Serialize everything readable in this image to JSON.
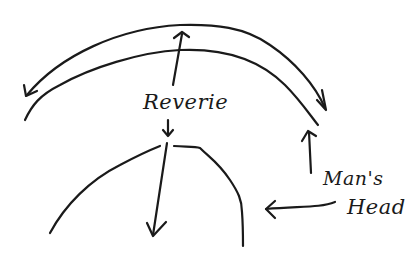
{
  "diagram": {
    "labels": {
      "reverie": "Reverie",
      "mans": "Man's",
      "head": "Head"
    },
    "elements": [
      {
        "id": "outer-arc",
        "type": "arc",
        "arrowheads": [
          "left-end",
          "right-end"
        ]
      },
      {
        "id": "inner-arc",
        "type": "arc"
      },
      {
        "id": "head-arc",
        "type": "arc",
        "description": "top of head outline"
      },
      {
        "id": "reverie-up-arrow",
        "from": "Reverie",
        "to": "arcs"
      },
      {
        "id": "reverie-down-arrow",
        "from": "Reverie",
        "to": "head-arc"
      },
      {
        "id": "head-interior-arrow",
        "direction": "down"
      },
      {
        "id": "mans-arrow-up",
        "from": "Man's",
        "to": "inner-arc"
      },
      {
        "id": "head-arrow-left",
        "from": "Head",
        "to": "head-arc"
      }
    ],
    "colors": {
      "ink": "#1a1a1a",
      "background": "#ffffff"
    }
  }
}
